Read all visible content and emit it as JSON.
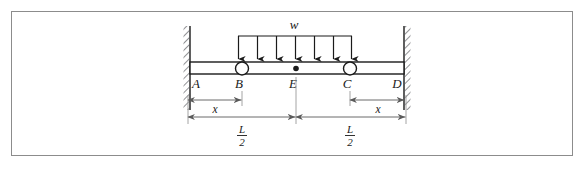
{
  "figure": {
    "type": "engineering-beam-diagram",
    "border_color": "#8c8c8c",
    "line_color": "#1a1a1a",
    "background": "#ffffff"
  },
  "diagram": {
    "load": {
      "label": "w",
      "label_x": 294,
      "label_y": 28,
      "bar_y": 36,
      "bar_x_start": 238,
      "bar_x_end": 352,
      "arrow_count": 7,
      "arrow_tip_y": 61,
      "arrow_xs": [
        238,
        257,
        276,
        295,
        314,
        333,
        352
      ]
    },
    "beam": {
      "x_start": 190,
      "x_end": 404,
      "top_y": 62,
      "bottom_y": 74,
      "fill": "#ffffff",
      "stroke": "#1a1a1a"
    },
    "walls": {
      "left": {
        "x": 184,
        "y_top": 26,
        "y_bottom": 110,
        "width": 6
      },
      "right": {
        "x": 404,
        "y_top": 26,
        "y_bottom": 110,
        "width": 6
      },
      "hatch_color": "#55565a"
    },
    "supports": [
      {
        "name": "B",
        "type": "roller-circle",
        "cx": 242,
        "cy": 69,
        "r": 6.5
      },
      {
        "name": "C",
        "type": "roller-circle",
        "cx": 350,
        "cy": 69,
        "r": 6.5
      }
    ],
    "point_markers": [
      {
        "name": "E",
        "type": "filled-dot",
        "cx": 296,
        "cy": 69,
        "r": 2.6
      }
    ],
    "node_labels": [
      {
        "text": "A",
        "x": 196,
        "y": 87
      },
      {
        "text": "B",
        "x": 239,
        "y": 87
      },
      {
        "text": "E",
        "x": 293,
        "y": 87
      },
      {
        "text": "C",
        "x": 347,
        "y": 87
      },
      {
        "text": "D",
        "x": 396,
        "y": 87
      }
    ],
    "dimensions": [
      {
        "id": "x-left",
        "label": "x",
        "y": 100,
        "x_start": 188,
        "x_end": 242,
        "label_x": 215,
        "label_y": 112
      },
      {
        "id": "x-right",
        "label": "x",
        "y": 100,
        "x_start": 350,
        "x_end": 405,
        "label_x": 378,
        "label_y": 112
      },
      {
        "id": "half-L-left",
        "numerator": "L",
        "denominator": "2",
        "y": 117,
        "x_start": 188,
        "x_end": 296,
        "label_x": 242,
        "num_y": 132,
        "den_y": 145,
        "bar_y": 135,
        "bar_half_width": 5
      },
      {
        "id": "half-L-right",
        "numerator": "L",
        "denominator": "2",
        "y": 117,
        "x_start": 296,
        "x_end": 405,
        "label_x": 350,
        "num_y": 132,
        "den_y": 145,
        "bar_y": 135,
        "bar_half_width": 5
      }
    ],
    "extension_lines": [
      {
        "id": "ext-B",
        "x": 242,
        "y_top": 76,
        "y_bottom": 104
      },
      {
        "id": "ext-C",
        "x": 350,
        "y_top": 76,
        "y_bottom": 104
      },
      {
        "id": "ext-E",
        "x": 296,
        "y_top": 76,
        "y_bottom": 122
      }
    ]
  }
}
